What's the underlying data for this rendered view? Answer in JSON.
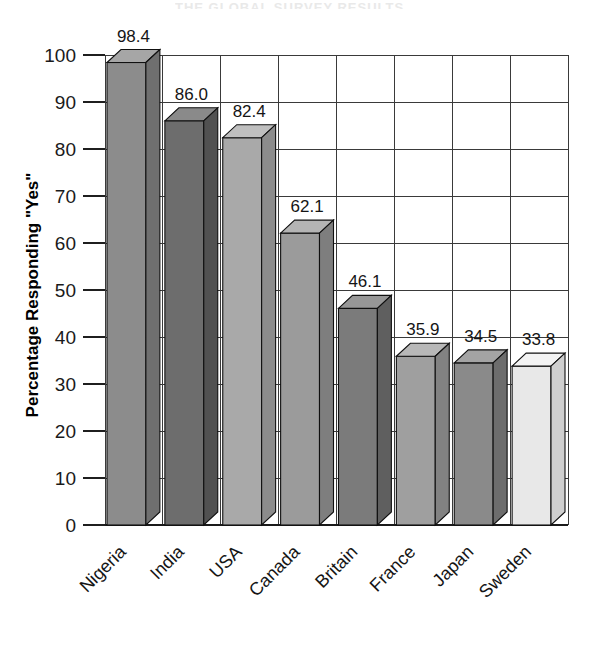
{
  "chart_data": {
    "type": "bar",
    "title": "",
    "xlabel": "",
    "ylabel": "Percentage Responding \"Yes\"",
    "ylim": [
      0,
      100
    ],
    "yticks": [
      0,
      10,
      20,
      30,
      40,
      50,
      60,
      70,
      80,
      90,
      100
    ],
    "grid": true,
    "legend": null,
    "style": "3d-bar",
    "categories": [
      "Nigeria",
      "India",
      "USA",
      "Canada",
      "Britain",
      "France",
      "Japan",
      "Sweden"
    ],
    "values": [
      98.4,
      86.0,
      82.4,
      62.1,
      46.1,
      35.9,
      34.5,
      33.8
    ],
    "value_labels": [
      "98.4",
      "86.0",
      "82.4",
      "62.1",
      "46.1",
      "35.9",
      "34.5",
      "33.8"
    ],
    "bar_colors": [
      "#8c8c8c",
      "#6d6d6d",
      "#a9a9a9",
      "#9b9b9b",
      "#7b7b7b",
      "#9f9f9f",
      "#8a8a8a",
      "#e8e8e8"
    ],
    "bar_top_colors": [
      "#a6a6a6",
      "#8a8a8a",
      "#bfbfbf",
      "#b4b4b4",
      "#979797",
      "#b8b8b8",
      "#a4a4a4",
      "#f3f3f3"
    ],
    "bar_side_colors": [
      "#6f6f6f",
      "#515151",
      "#8c8c8c",
      "#7e7e7e",
      "#5f5f5f",
      "#828282",
      "#6d6d6d",
      "#cfcfcf"
    ]
  },
  "axis": {
    "tick_labels": [
      "100",
      "90",
      "80",
      "70",
      "60",
      "50",
      "40",
      "30",
      "20",
      "10",
      "0"
    ],
    "y_title": "Percentage Responding \"Yes\""
  },
  "header": {
    "cropped_title": "THE GLOBAL SURVEY RESULTS"
  }
}
